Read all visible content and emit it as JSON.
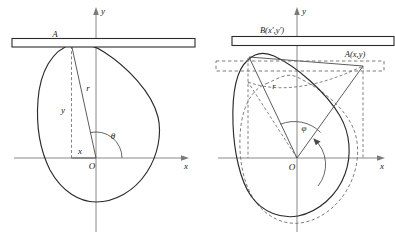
{
  "figure": {
    "background_color": "#ffffff",
    "curve_color": "#2b2b2b",
    "axis_color": "#7a7a7a",
    "dash_color": "#6e6e6e"
  },
  "panels": [
    {
      "id": "left",
      "name": "original-position",
      "axes": {
        "x_label": "x",
        "y_label": "y",
        "origin_label": "O"
      },
      "labels": {
        "contact_point": "A",
        "radius": "r",
        "ordinate": "y",
        "abscissa": "x",
        "angle": "θ"
      }
    },
    {
      "id": "right",
      "name": "rotated-position",
      "axes": {
        "x_label": "x",
        "y_label": "y",
        "origin_label": "O"
      },
      "labels": {
        "point_b": "B(x′,y′)",
        "point_a": "A(x,y)",
        "radius": "r",
        "angle": "φ"
      }
    }
  ]
}
